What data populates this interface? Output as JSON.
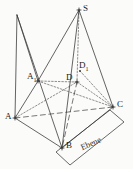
{
  "figure": {
    "type": "geometry-diagram",
    "language": "de",
    "width": 133,
    "height": 169,
    "background_color": "#fbfbfa",
    "stroke_color": "#3a3a3a",
    "label_color": "#1b1b1b"
  },
  "points": [
    {
      "id": "S",
      "label": "S",
      "sub": "",
      "x": 79,
      "y": 10,
      "label_x": 83,
      "label_y": 4,
      "marker": "cross"
    },
    {
      "id": "T",
      "label": "",
      "sub": "",
      "x": 17,
      "y": 15,
      "label_x": 0,
      "label_y": 0,
      "marker": "none"
    },
    {
      "id": "A1",
      "label": "A",
      "sub": "1",
      "x": 38,
      "y": 81,
      "label_x": 27,
      "label_y": 72,
      "marker": "cross"
    },
    {
      "id": "D1",
      "label": "D",
      "sub": "1",
      "x": 80,
      "y": 71,
      "label_x": 79,
      "label_y": 61,
      "marker": "dot"
    },
    {
      "id": "D",
      "label": "D",
      "sub": "",
      "x": 77,
      "y": 82,
      "label_x": 66,
      "label_y": 73,
      "marker": "cross"
    },
    {
      "id": "A",
      "label": "A",
      "sub": "",
      "x": 15,
      "y": 118,
      "label_x": 5,
      "label_y": 112,
      "marker": "cross"
    },
    {
      "id": "C",
      "label": "C",
      "sub": "",
      "x": 113,
      "y": 107,
      "label_x": 117,
      "label_y": 100,
      "marker": "cross"
    },
    {
      "id": "B",
      "label": "B",
      "sub": "",
      "x": 62,
      "y": 148,
      "label_x": 66,
      "label_y": 141,
      "marker": "cross"
    }
  ],
  "plane": {
    "label": "Ebene",
    "label_x": 79,
    "label_y": 143,
    "rotation_deg": -24,
    "corners": [
      {
        "x": 56,
        "y": 152
      },
      {
        "x": 110,
        "y": 110
      },
      {
        "x": 124,
        "y": 122
      },
      {
        "x": 70,
        "y": 165
      }
    ]
  },
  "edges_solid": [
    {
      "name": "S-A1",
      "from": "S",
      "to": "A1"
    },
    {
      "name": "S-B",
      "from": "S",
      "to": "B"
    },
    {
      "name": "S-C",
      "from": "S",
      "to": "C"
    },
    {
      "name": "T-A1",
      "from": "T",
      "to": "A1"
    },
    {
      "name": "T-A",
      "from": "T",
      "to": "A"
    },
    {
      "name": "T-B",
      "from": "T",
      "to": "B"
    },
    {
      "name": "A1-A",
      "from": "A1",
      "to": "A"
    },
    {
      "name": "A-B",
      "from": "A",
      "to": "B"
    },
    {
      "name": "B-C",
      "from": "B",
      "to": "C"
    }
  ],
  "edges_dashed": [
    {
      "name": "S-D1-D",
      "from": "S",
      "to": "D"
    },
    {
      "name": "A1-D",
      "from": "A1",
      "to": "D"
    },
    {
      "name": "A-D",
      "from": "A",
      "to": "D"
    },
    {
      "name": "D-C",
      "from": "D",
      "to": "C"
    },
    {
      "name": "D1-C",
      "from": "D1",
      "to": "C"
    },
    {
      "name": "A1-C",
      "from": "A1",
      "to": "C"
    }
  ],
  "edges_longdash": [
    {
      "name": "A-C",
      "from": "A",
      "to": "C"
    },
    {
      "name": "D-B",
      "from": "D",
      "to": "B"
    }
  ]
}
